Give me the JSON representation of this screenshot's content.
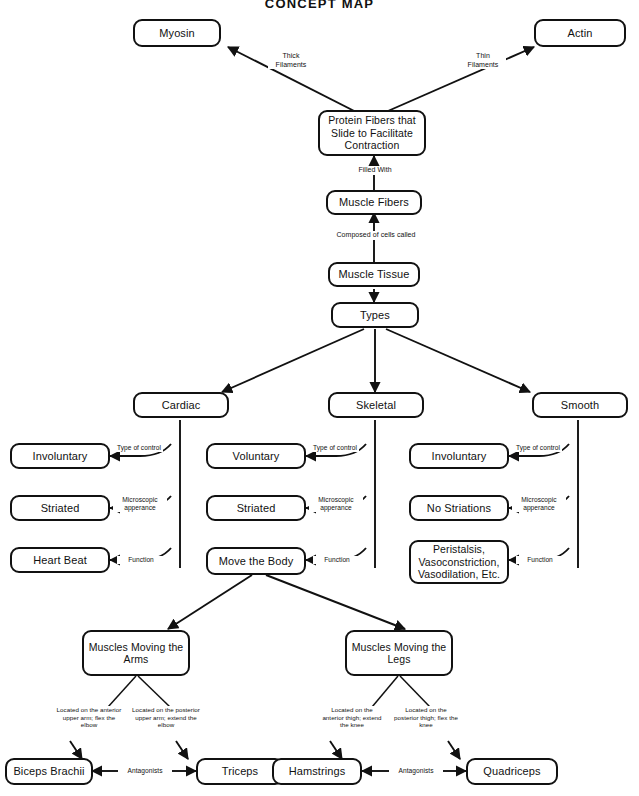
{
  "title": "CONCEPT MAP",
  "nodes": {
    "myosin": "Myosin",
    "actin": "Actin",
    "protein_fibers": "Protein Fibers that Slide to Facilitate Contraction",
    "muscle_fibers": "Muscle Fibers",
    "muscle_tissue": "Muscle Tissue",
    "types": "Types",
    "cardiac": "Cardiac",
    "skeletal": "Skeletal",
    "smooth": "Smooth",
    "cardiac_control": "Involuntary",
    "cardiac_micro": "Striated",
    "cardiac_function": "Heart Beat",
    "skeletal_control": "Voluntary",
    "skeletal_micro": "Striated",
    "skeletal_function": "Move the Body",
    "smooth_control": "Involuntary",
    "smooth_micro": "No Striations",
    "smooth_function": "Peristalsis, Vasoconstriction, Vasodilation, Etc.",
    "muscles_arms": "Muscles Moving the Arms",
    "muscles_legs": "Muscles Moving the Legs",
    "biceps": "Biceps Brachii",
    "triceps": "Triceps",
    "hamstrings": "Hamstrings",
    "quadriceps": "Quadriceps"
  },
  "edge_labels": {
    "thick_filaments": "Thick Filaments",
    "thin_filaments": "Thin Filaments",
    "filled_with": "Filled With",
    "composed_of": "Composed of cells called",
    "cardiac_type_of_control": "Type of control",
    "cardiac_microscopic": "Microscopic apperance",
    "cardiac_function_label": "Function",
    "skeletal_type_of_control": "Type of control",
    "skeletal_microscopic": "Microscopic apperance",
    "skeletal_function_label": "Function",
    "smooth_type_of_control": "Type of control",
    "smooth_microscopic": "Microscopic apperance",
    "smooth_function_label": "Function",
    "biceps_location": "Located on the anterior upper arm; flex the elbow",
    "triceps_location": "Located on the posterior upper arm; extend the elbow",
    "hamstrings_location": "Located on the anterior thigh; extend the knee",
    "quadriceps_location": "Located on the posterior thigh; flex the knee",
    "arms_antagonists": "Antagonists",
    "legs_antagonists": "Antagonists"
  },
  "colors": {
    "stroke": "#111111",
    "background": "#ffffff",
    "text": "#111111"
  }
}
